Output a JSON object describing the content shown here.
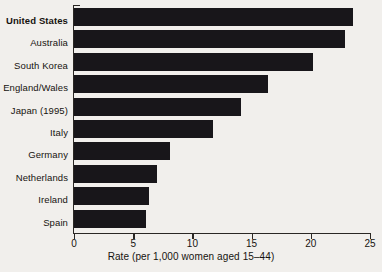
{
  "chart_data": {
    "type": "bar",
    "orientation": "horizontal",
    "title": "",
    "xlabel": "Rate (per 1,000 women aged 15–44)",
    "ylabel": "",
    "xlim": [
      0,
      25
    ],
    "xticks": [
      0,
      5,
      10,
      15,
      20,
      25
    ],
    "xtick_labels": [
      "0",
      "5",
      "10",
      "15",
      "20",
      "25"
    ],
    "grid": false,
    "legend": null,
    "bar_color": "#18161a",
    "background_color": "#f1efec",
    "highlighted_category": "United States",
    "categories": [
      "United States",
      "Australia",
      "South Korea",
      "England/Wales",
      "Japan (1995)",
      "Italy",
      "Germany",
      "Netherlands",
      "Ireland",
      "Spain"
    ],
    "values": [
      23.6,
      22.9,
      20.2,
      16.4,
      14.1,
      11.7,
      8.1,
      7.0,
      6.3,
      6.1
    ]
  }
}
